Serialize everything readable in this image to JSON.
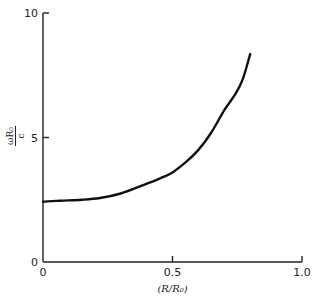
{
  "chart_data": {
    "type": "line",
    "title": "",
    "xlabel": "(R/R₀)",
    "ylabel": {
      "numerator": "ωR₀",
      "denominator": "c"
    },
    "xlim": [
      0,
      1.0
    ],
    "ylim": [
      0,
      10
    ],
    "grid": false,
    "legend": "none",
    "x_ticks": [
      {
        "value": 0,
        "label": "0"
      },
      {
        "value": 0.5,
        "label": "0.5"
      },
      {
        "value": 1.0,
        "label": "1.0"
      }
    ],
    "y_ticks": [
      {
        "value": 0,
        "label": "0"
      },
      {
        "value": 5,
        "label": "5"
      },
      {
        "value": 10,
        "label": "10"
      }
    ],
    "series": [
      {
        "name": "omega R0 / c",
        "x": [
          0.0,
          0.066,
          0.15,
          0.22,
          0.3,
          0.39,
          0.45,
          0.5,
          0.55,
          0.6,
          0.65,
          0.7,
          0.74,
          0.77,
          0.8
        ],
        "y": [
          2.42,
          2.46,
          2.5,
          2.57,
          2.75,
          3.1,
          3.35,
          3.6,
          4.0,
          4.5,
          5.2,
          6.1,
          6.7,
          7.3,
          8.35
        ]
      }
    ]
  }
}
